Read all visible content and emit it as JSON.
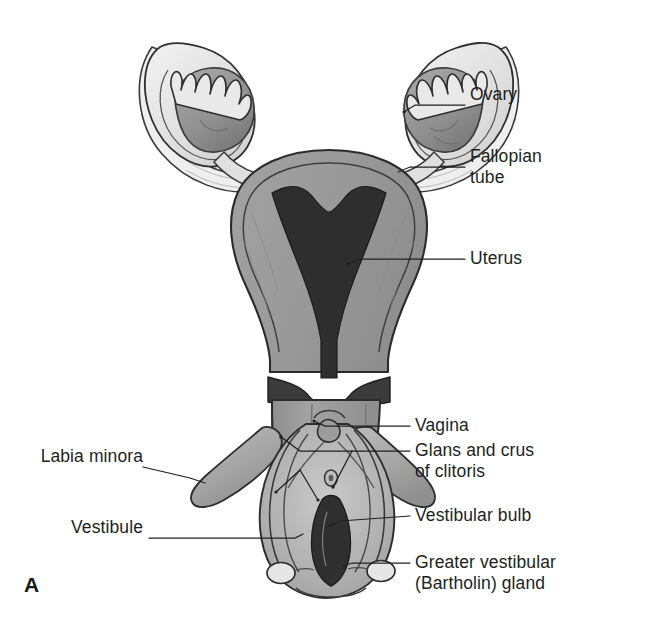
{
  "figure": {
    "panel_letter": "A",
    "background_color": "#ffffff",
    "line_color": "#231f20",
    "palette": {
      "outline": "#2b2b2b",
      "myometrium": "#9a9a9a",
      "uterine_cavity": "#2e2e2e",
      "ovary": "#8f8f8f",
      "ovary_shadow": "#7d7d7d",
      "tube_light": "#e6e6e6",
      "broad_ligament": "#efefef",
      "vagina": "#9e9e9e",
      "vestibule_dark": "#3a3a3a",
      "labia": "#b0b0b0",
      "bulb": "#a8a8a8",
      "bartholin": "#e4e4e4",
      "text": "#231f20"
    }
  },
  "labels": [
    {
      "id": "ovary",
      "text": "Ovary",
      "side": "right",
      "x": 470,
      "y": 94,
      "leader": [
        [
          465,
          105
        ],
        [
          415,
          105
        ],
        [
          404,
          112
        ]
      ]
    },
    {
      "id": "fallopian-tube",
      "text": "Fallopian\ntube",
      "side": "right",
      "x": 470,
      "y": 156,
      "leader": [
        [
          465,
          167
        ],
        [
          410,
          167
        ],
        [
          398,
          172
        ]
      ]
    },
    {
      "id": "uterus",
      "text": "Uterus",
      "side": "right",
      "x": 470,
      "y": 248,
      "leader": [
        [
          465,
          259
        ],
        [
          360,
          259
        ],
        [
          348,
          264
        ]
      ]
    },
    {
      "id": "vagina",
      "text": "Vagina",
      "side": "right",
      "x": 415,
      "y": 415,
      "leader": [
        [
          410,
          426
        ],
        [
          325,
          426
        ],
        [
          314,
          421
        ]
      ]
    },
    {
      "id": "glans-crus-clitoris",
      "text": "Glans and crus\nof clitoris",
      "side": "right",
      "x": 415,
      "y": 440,
      "leader": [
        [
          410,
          451
        ],
        [
          300,
          451
        ],
        [
          281,
          437
        ]
      ],
      "leader2": [
        [
          352,
          451
        ],
        [
          333,
          487
        ]
      ]
    },
    {
      "id": "vestibular-bulb",
      "text": "Vestibular bulb",
      "side": "right",
      "x": 415,
      "y": 505,
      "leader": [
        [
          410,
          516
        ],
        [
          340,
          521
        ],
        [
          331,
          525
        ]
      ]
    },
    {
      "id": "greater-vestibular-gland",
      "text": "Greater vestibular\n(Bartholin) gland",
      "side": "right",
      "x": 415,
      "y": 552,
      "leader": [
        [
          410,
          563
        ],
        [
          352,
          563
        ],
        [
          343,
          566
        ]
      ]
    },
    {
      "id": "labia-minora",
      "text": "Labia minora",
      "side": "left",
      "x": 30,
      "y": 456,
      "leader": [
        [
          143,
          467
        ],
        [
          190,
          478
        ],
        [
          205,
          483
        ]
      ]
    },
    {
      "id": "vestibule",
      "text": "Vestibule",
      "side": "left",
      "x": 62,
      "y": 527,
      "leader": [
        [
          149,
          538
        ],
        [
          295,
          538
        ],
        [
          303,
          534
        ]
      ]
    }
  ]
}
